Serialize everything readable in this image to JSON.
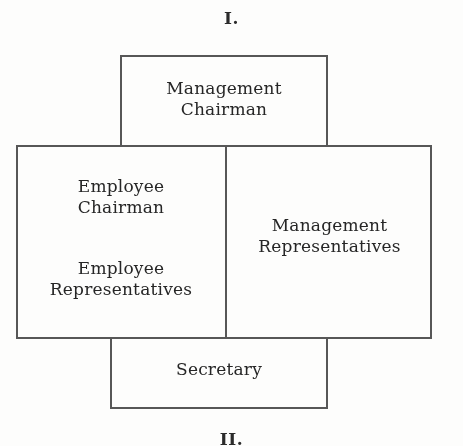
{
  "figure": {
    "numeral_top": "I.",
    "numeral_bottom": "II.",
    "ink_color": "#3b3b3b",
    "background_color": "#fdfdfc"
  },
  "boxes": {
    "management_chairman": {
      "title_line1": "Management",
      "title_line2": "Chairman"
    },
    "employee_chairman": {
      "title_line1": "Employee",
      "title_line2": "Chairman"
    },
    "employee_representatives": {
      "title_line1": "Employee",
      "title_line2": "Representatives"
    },
    "management_representatives": {
      "title_line1": "Management",
      "title_line2": "Representatives"
    },
    "secretary": {
      "title_line1": "Secretary"
    }
  }
}
